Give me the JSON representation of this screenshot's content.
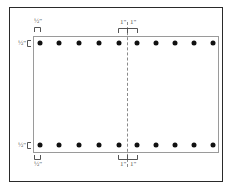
{
  "diagram": {
    "outer_frame": {
      "x": 9,
      "y": 7,
      "width": 214,
      "height": 175
    },
    "inner_rect": {
      "x": 33,
      "y": 36,
      "width": 186,
      "height": 117
    },
    "dot_rows": {
      "top_y": 43,
      "bottom_y": 145,
      "x_positions": [
        40,
        59,
        79,
        99,
        119,
        137,
        156,
        175,
        194,
        213
      ]
    },
    "center_line_x": 127,
    "labels": {
      "top_left_offset": "½\"",
      "left_top_offset": "½\"",
      "left_bottom_offset": "½\"",
      "bottom_left_offset": "½\"",
      "top_center_left": "1\"",
      "top_center_right": "1\"",
      "bottom_center_left": "1\"",
      "bottom_center_right": "1\""
    },
    "colors": {
      "frame": "#2a2a2a",
      "inner": "#9a9a9a",
      "dot": "#111111",
      "dash": "#8a8a8a",
      "label": "#555555"
    }
  }
}
